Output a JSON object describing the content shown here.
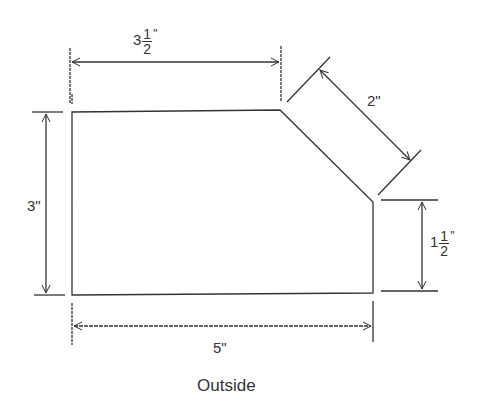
{
  "diagram": {
    "caption": "Outside",
    "stroke_color": "#333333",
    "dimensions": {
      "top": {
        "whole": "3",
        "num": "1",
        "den": "2",
        "unit": "\""
      },
      "diagonal": {
        "text": "2\""
      },
      "right": {
        "whole": "1",
        "num": "1",
        "den": "2",
        "unit": "\""
      },
      "left": {
        "text": "3\""
      },
      "bottom": {
        "text": "5\""
      }
    }
  }
}
